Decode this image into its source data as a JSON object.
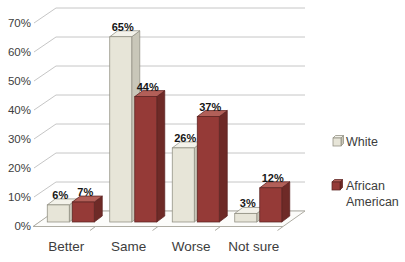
{
  "chart_data": {
    "type": "bar",
    "variant": "3d-clustered-column",
    "title": "",
    "xlabel": "",
    "ylabel": "",
    "categories": [
      "Better",
      "Same",
      "Worse",
      "Not sure"
    ],
    "series": [
      {
        "name": "White",
        "values": [
          6,
          65,
          26,
          3
        ],
        "data_labels": [
          "6%",
          "65%",
          "26%",
          "3%"
        ]
      },
      {
        "name": "African American",
        "values": [
          7,
          44,
          37,
          12
        ],
        "data_labels": [
          "7%",
          "44%",
          "37%",
          "12%"
        ]
      }
    ],
    "ylim": [
      0,
      70
    ],
    "ytick_step": 10,
    "ytick_labels": [
      "0%",
      "10%",
      "20%",
      "30%",
      "40%",
      "50%",
      "60%",
      "70%"
    ],
    "grid": "on",
    "legend_position": "right",
    "legend_entries": [
      {
        "label": "White",
        "lines": [
          "White"
        ]
      },
      {
        "label": "African American",
        "lines": [
          "African",
          "American"
        ]
      }
    ]
  },
  "colors": {
    "series_fills": [
      {
        "front": "#e7e5d8",
        "top": "#f3f2ea",
        "side": "#c9c7b9",
        "stroke": "#8f8d80"
      },
      {
        "front": "#953a37",
        "top": "#b25f58",
        "side": "#6e2a27",
        "stroke": "#5c2321"
      }
    ],
    "gridline": "#c6c6c6",
    "tick": "#b8b8b8",
    "floor_stroke": "#aeaca3",
    "floor_fill": "#fcfcfa",
    "axis_text": "#404040",
    "category_text": "#3d3d3d",
    "data_label_text": "#161616",
    "legend_text": "#3d3d3d",
    "background": "#ffffff"
  }
}
